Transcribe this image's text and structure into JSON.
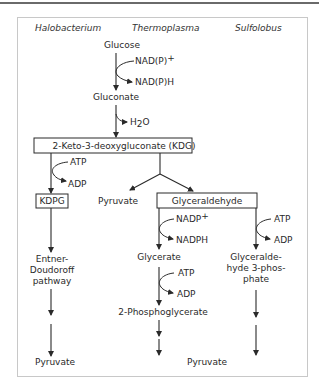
{
  "organisms": {
    "halobacterium": "Halobacterium",
    "thermoplasma": "Thermoplasma",
    "sulfolobus": "Sulfolobus"
  },
  "common": {
    "glucose": "Glucose",
    "nadp_plus": "NAD(P)",
    "nadp_plus_sup": "+",
    "nadph": "NAD(P)H",
    "gluconate": "Gluconate",
    "h2o_h": "H",
    "h2o_sub": "2",
    "h2o_o": "O",
    "kdg": "2-Keto-3-deoxygluconate (KDG)"
  },
  "halobacterium_path": {
    "atp": "ATP",
    "adp": "ADP",
    "kdpg": "KDPG",
    "ed_line1": "Entner-",
    "ed_line2": "Doudoroff",
    "ed_line3": "pathway",
    "pyruvate": "Pyruvate"
  },
  "thermoplasma_path": {
    "pyruvate_direct": "Pyruvate",
    "glyceraldehyde": "Glyceraldehyde",
    "nadp_plus": "NADP",
    "nadp_plus_sup": "+",
    "nadph": "NADPH",
    "glycerate": "Glycerate",
    "atp": "ATP",
    "adp": "ADP",
    "phosphoglycerate": "2-Phosphoglycerate",
    "pyruvate": "Pyruvate"
  },
  "sulfolobus_path": {
    "atp": "ATP",
    "adp": "ADP",
    "g3p_line1": "Glyceralde-",
    "g3p_line2": "hyde 3-phos-",
    "g3p_line3": "phate"
  }
}
